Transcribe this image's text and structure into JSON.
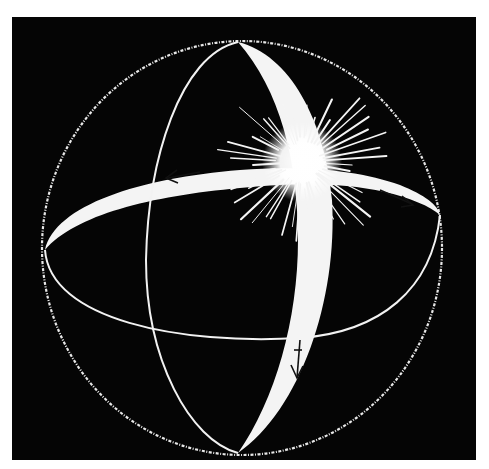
{
  "figure": {
    "title": "Sphere with two intersecting orbital paths converging at a burst",
    "background_color": "#050505",
    "line_color": "#f2f2f2",
    "outer_sphere": {
      "cx": 242,
      "cy": 248,
      "rx": 200,
      "ry": 207
    },
    "vertical_orbit": {
      "top": [
        238,
        42
      ],
      "bottom": [
        238,
        453
      ],
      "left_x": 146,
      "right_x": 332
    },
    "horizontal_orbit": {
      "left": [
        45,
        250
      ],
      "right": [
        440,
        210
      ],
      "top_y": 158,
      "bottom_y": 340
    },
    "burst": {
      "cx": 302,
      "cy": 162,
      "rays": 48,
      "label": "burst"
    },
    "arrows": [
      {
        "label": "arrow-left",
        "direction": "left",
        "x": 168,
        "y": 175
      },
      {
        "label": "arrow-right",
        "direction": "down-right",
        "x": 410,
        "y": 205
      },
      {
        "label": "arrow-down",
        "direction": "down",
        "x": 297,
        "y": 375
      }
    ]
  }
}
